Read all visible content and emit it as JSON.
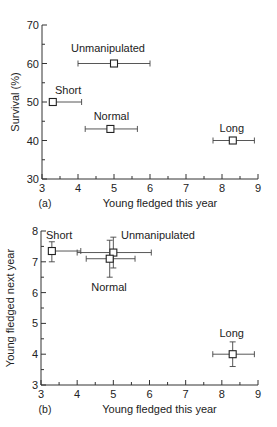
{
  "chart_data": [
    {
      "type": "scatter",
      "panel": "(a)",
      "xlabel": "Young fledged this year",
      "ylabel": "Survival (%)",
      "xlim": [
        3,
        9
      ],
      "ylim": [
        30,
        70
      ],
      "xticks": [
        3,
        4,
        5,
        6,
        7,
        8,
        9
      ],
      "yticks": [
        30,
        40,
        50,
        60,
        70
      ],
      "grid": false,
      "points": [
        {
          "label": "Unmanipulated",
          "x": 5.0,
          "y": 60,
          "xerr": [
            4.0,
            6.0
          ],
          "yerr": null,
          "label_pos": "above"
        },
        {
          "label": "Short",
          "x": 3.3,
          "y": 50,
          "xerr": [
            3.3,
            4.1
          ],
          "yerr": null,
          "label_pos": "above"
        },
        {
          "label": "Normal",
          "x": 4.9,
          "y": 43,
          "xerr": [
            4.2,
            5.65
          ],
          "yerr": null,
          "label_pos": "above"
        },
        {
          "label": "Long",
          "x": 8.3,
          "y": 40,
          "xerr": [
            7.75,
            8.9
          ],
          "yerr": null,
          "label_pos": "above"
        }
      ]
    },
    {
      "type": "scatter",
      "panel": "(b)",
      "xlabel": "Young fledged this year",
      "ylabel": "Young fledged next year",
      "xlim": [
        3,
        9
      ],
      "ylim": [
        3,
        8
      ],
      "xticks": [
        3,
        4,
        5,
        6,
        7,
        8,
        9
      ],
      "yticks": [
        3,
        4,
        5,
        6,
        7,
        8
      ],
      "grid": false,
      "points": [
        {
          "label": "Short",
          "x": 3.3,
          "y": 7.35,
          "xerr": [
            3.3,
            4.1
          ],
          "yerr": [
            7.0,
            7.65
          ],
          "label_pos": "above"
        },
        {
          "label": "Unmanipulated",
          "x": 5.0,
          "y": 7.3,
          "xerr": [
            4.0,
            6.05
          ],
          "yerr": [
            6.8,
            7.8
          ],
          "label_pos": "above-right"
        },
        {
          "label": "Normal",
          "x": 4.9,
          "y": 7.1,
          "xerr": [
            4.25,
            5.6
          ],
          "yerr": [
            6.5,
            7.7
          ],
          "label_pos": "below"
        },
        {
          "label": "Long",
          "x": 8.3,
          "y": 4.0,
          "xerr": [
            7.75,
            8.9
          ],
          "yerr": [
            3.6,
            4.4
          ],
          "label_pos": "above"
        }
      ]
    }
  ]
}
